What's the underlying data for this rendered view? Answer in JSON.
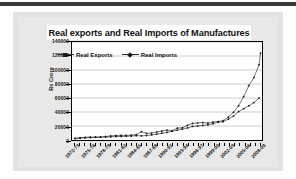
{
  "page": {
    "background": "#e2e2e2",
    "panel_background": "#e8e8e8"
  },
  "chart_data": {
    "type": "line",
    "title": "Real exports and Real Imports of Manufactures",
    "xlabel": "",
    "ylabel": "Rs Crore",
    "ylim": [
      0,
      140000
    ],
    "ytick_labels": [
      "140000",
      "120000",
      "100000",
      "80000",
      "60000",
      "40000",
      "20000",
      "0"
    ],
    "ytick_values": [
      140000,
      120000,
      100000,
      80000,
      60000,
      40000,
      20000,
      0
    ],
    "grid": true,
    "legend_position": "upper-left-inside",
    "x": [
      "1972-73",
      "1973-74",
      "1974-75",
      "1975-76",
      "1976-77",
      "1977-78",
      "1978-79",
      "1979-80",
      "1980-81",
      "1981-82",
      "1982-83",
      "1983-84",
      "1984-85",
      "1985-86",
      "1986-87",
      "1987-88",
      "1988-89",
      "1989-90",
      "1990-91",
      "1991-92",
      "1992-93",
      "1993-94",
      "1994-95",
      "1995-96",
      "1996-97",
      "1997-98",
      "1998-99",
      "1999-00",
      "2000-01",
      "2001-02",
      "2002-03",
      "2003-04",
      "2004-05",
      "2005-06",
      "2006-07",
      "2007-08",
      "2008-09"
    ],
    "xtick_labels": [
      "1972-73",
      "1975-76",
      "1978-79",
      "1981-82",
      "1984-85",
      "1987-88",
      "1990-91",
      "1993-94",
      "1996-97",
      "1999-00",
      "2002-03",
      "2005-06",
      "2008-09"
    ],
    "series": [
      {
        "name": "Real Exports",
        "marker": "square",
        "color": "#1a1a1a",
        "values": [
          2100,
          2600,
          3100,
          3500,
          3900,
          4000,
          4200,
          4600,
          4900,
          5100,
          5400,
          5600,
          6200,
          5900,
          6400,
          7300,
          8200,
          9600,
          10800,
          12400,
          13900,
          15600,
          17200,
          19400,
          20100,
          20800,
          21600,
          23200,
          25400,
          26100,
          29800,
          34200,
          40600,
          44700,
          48900,
          53400,
          59800
        ]
      },
      {
        "name": "Real Imports",
        "marker": "diamond",
        "color": "#1a1a1a",
        "values": [
          2400,
          3000,
          3900,
          4100,
          4000,
          4300,
          5000,
          5800,
          6400,
          6700,
          6600,
          6900,
          7600,
          11900,
          9400,
          9900,
          11400,
          12800,
          14100,
          13200,
          16900,
          17400,
          20900,
          23600,
          24300,
          24800,
          24100,
          25600,
          26400,
          27600,
          32800,
          39600,
          48900,
          62100,
          77600,
          89200,
          107400
        ]
      }
    ],
    "series_end_note": {
      "real_imports_final_point": 124000
    }
  }
}
